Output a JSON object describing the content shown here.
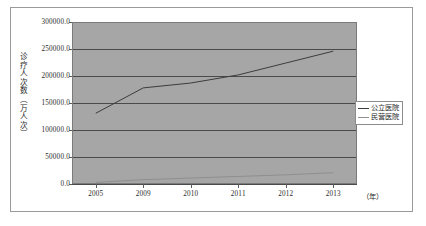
{
  "chart_data": {
    "type": "line",
    "title": "",
    "xlabel": "年",
    "ylabel": "诊疗人次数（万人次）",
    "x": [
      "2005",
      "2009",
      "2010",
      "2011",
      "2012",
      "2013"
    ],
    "xtick_labels": [
      "2005",
      "2009",
      "2010",
      "2011",
      "2012",
      "2013"
    ],
    "x_unit_label": "（年）",
    "ytick_labels": [
      "300000.0",
      "250000.0",
      "200000.0",
      "150000.0",
      "100000.0",
      "50000.0",
      "0.0"
    ],
    "ytick_values": [
      300000,
      250000,
      200000,
      150000,
      100000,
      50000,
      0
    ],
    "ylim": [
      0,
      300000
    ],
    "grid": true,
    "legend_position": "center right",
    "series": [
      {
        "name": "公立医院",
        "color": "#3c3c3c",
        "values": [
          131000,
          178000,
          187000,
          202000,
          224000,
          246000
        ]
      },
      {
        "name": "民营医院",
        "color": "#8f8f8f",
        "values": [
          3000,
          8000,
          11000,
          14000,
          17000,
          21000
        ]
      }
    ]
  },
  "legend": {
    "items": [
      {
        "label": "公立医院",
        "color": "#3c3c3c"
      },
      {
        "label": "民营医院",
        "color": "#8f8f8f"
      }
    ]
  },
  "style": {
    "plot_background": "#a6a6a6",
    "gridline_color": "#4a4a4a",
    "frame_color": "#9a9a9a",
    "page_background": "#ffffff"
  }
}
